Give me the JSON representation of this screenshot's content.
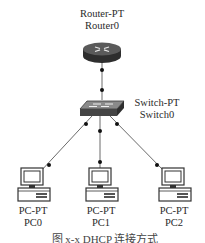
{
  "diagram": {
    "type": "network-topology",
    "nodes": [
      {
        "id": "router0",
        "model": "Router-PT",
        "name": "Router0",
        "icon": "router-icon"
      },
      {
        "id": "switch0",
        "model": "Switch-PT",
        "name": "Switch0",
        "icon": "switch-icon"
      },
      {
        "id": "pc0",
        "model": "PC-PT",
        "name": "PC0",
        "icon": "pc-icon"
      },
      {
        "id": "pc1",
        "model": "PC-PT",
        "name": "PC1",
        "icon": "pc-icon"
      },
      {
        "id": "pc2",
        "model": "PC-PT",
        "name": "PC2",
        "icon": "pc-icon"
      }
    ],
    "links": [
      {
        "from": "router0",
        "to": "switch0"
      },
      {
        "from": "switch0",
        "to": "pc0"
      },
      {
        "from": "switch0",
        "to": "pc1"
      },
      {
        "from": "switch0",
        "to": "pc2"
      }
    ],
    "caption": "图 x-x  DHCP 连接方式"
  },
  "colors": {
    "link": "#6a6a6a",
    "endpoint_dot": "#111111",
    "device_dark": "#3a3a3a"
  }
}
